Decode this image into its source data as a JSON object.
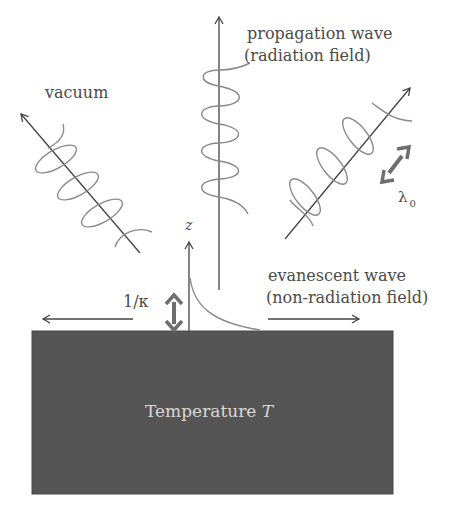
{
  "diagram": {
    "labels": {
      "vacuum": "vacuum",
      "propagation_line1": "propagation wave",
      "propagation_line2": "(radiation field)",
      "evanescent_line1": "evanescent wave",
      "evanescent_line2": "(non-radiation field)",
      "z_axis": "z",
      "decay_length": "1/κ",
      "wavelength_symbol": "λ",
      "wavelength_subscript": "0",
      "block_text": "Temperature ",
      "block_var": "T"
    },
    "colors": {
      "block_fill": "#555555",
      "line": "#555555",
      "wave": "#8a8a8a",
      "thick_arrow": "#6e6e6e",
      "block_text": "#d8d8d8"
    }
  }
}
